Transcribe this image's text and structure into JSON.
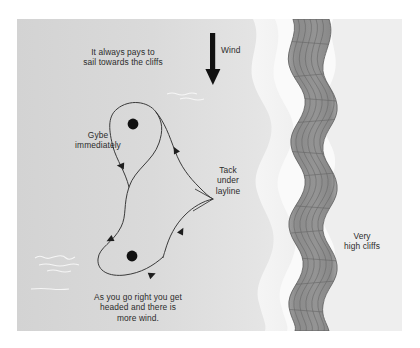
{
  "diagram": {
    "type": "sailing-tactics-illustration",
    "background_color": "#dcdcdc",
    "ink_color": "#2b2b2b",
    "cliff_color": "#8e8e8e",
    "shore_color": "#f7f7f7"
  },
  "labels": {
    "top_advice": "It always pays to\nsail towards the cliffs",
    "wind": "Wind",
    "gybe": "Gybe\nimmediately",
    "tack": "Tack\nunder\nlayline",
    "cliffs": "Very\nhigh cliffs",
    "bottom_advice": "As you go right you get\nheaded and there is\nmore wind."
  },
  "elements": {
    "wind_arrow": "down-arrow-icon",
    "upper_mark": "race-mark-dot",
    "lower_mark": "race-mark-dot",
    "track": "boat-track-path",
    "track_arrowheads": 5,
    "water_ripples": 4,
    "cliff_band": "cliff-face"
  }
}
